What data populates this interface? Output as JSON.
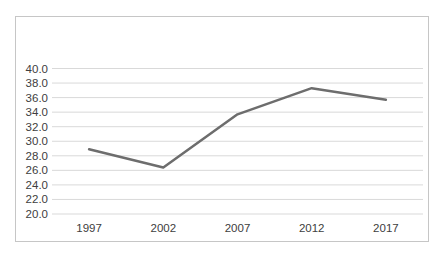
{
  "chart_data": {
    "type": "line",
    "title": "",
    "categories": [
      "1997",
      "2002",
      "2007",
      "2012",
      "2017"
    ],
    "series": [
      {
        "name": "",
        "values": [
          28.9,
          26.4,
          33.7,
          37.3,
          35.7
        ]
      }
    ],
    "xlabel": "",
    "ylabel": "",
    "ylim": [
      20.0,
      40.0
    ],
    "ytick_step": 2.0,
    "ytick_labels": [
      "40.0",
      "38.0",
      "36.0",
      "34.0",
      "32.0",
      "30.0",
      "28.0",
      "26.0",
      "24.0",
      "22.0",
      "20.0"
    ],
    "grid": true,
    "legend": "none",
    "markers": "none",
    "colors": {
      "background": "#ffffff",
      "frame_border": "#c6c6c6",
      "gridline": "#d9d9d9",
      "series_line": "#6d6d6d",
      "axis_label_text": "#404040"
    }
  }
}
